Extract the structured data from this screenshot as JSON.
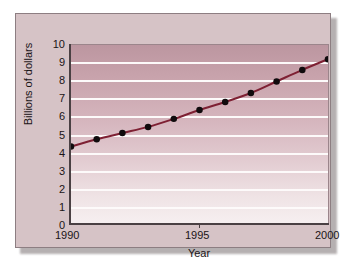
{
  "chart_data": {
    "type": "line",
    "title": "",
    "xlabel": "Year",
    "ylabel": "Billions of dollars",
    "x": [
      1990,
      1991,
      1992,
      1993,
      1994,
      1995,
      1996,
      1997,
      1998,
      1999,
      2000
    ],
    "values": [
      4.3,
      4.7,
      5.05,
      5.4,
      5.85,
      6.35,
      6.8,
      7.3,
      7.95,
      8.6,
      9.2
    ],
    "series": [
      {
        "name": "Billions of dollars",
        "values": [
          4.3,
          4.7,
          5.05,
          5.4,
          5.85,
          6.35,
          6.8,
          7.3,
          7.95,
          8.6,
          9.2
        ]
      }
    ],
    "xlim": [
      1990,
      2000
    ],
    "ylim": [
      0,
      10
    ],
    "ytick_labels": [
      "10",
      "9",
      "8",
      "7",
      "6",
      "5",
      "4",
      "3",
      "2",
      "1",
      "0"
    ],
    "ytick_values": [
      10,
      9,
      8,
      7,
      6,
      5,
      4,
      3,
      2,
      1,
      0
    ],
    "xtick_labels": [
      "1990",
      "1995",
      "2000"
    ],
    "xtick_values": [
      1990,
      1995,
      2000
    ],
    "grid": "horizontal",
    "grid_color": "#fdfafa",
    "legend": "none",
    "line_color": "#7e2033",
    "marker_color": "#100b0d",
    "marker": "circle",
    "plot_background_top": "#bc96a0",
    "plot_background_bottom": "#f6eff0",
    "card_background": "#d6c3c6",
    "axis_color": "#4a4043"
  }
}
